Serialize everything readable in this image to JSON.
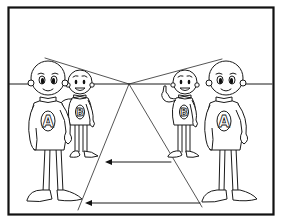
{
  "panel": {
    "description": "Perspective drawing lesson panel: two pairs of characters (A and B) placed on either side of a vanishing point, with horizon line, perspective guide lines and arrows showing depth",
    "frame_color": "#111111",
    "background_color": "#ffffff"
  },
  "horizon": {
    "y": 84,
    "label": "horizon line"
  },
  "vanishing_point": {
    "x": 129,
    "y": 84
  },
  "characters": [
    {
      "id": "left-a",
      "letter": "A",
      "side": "left",
      "size": "large",
      "expression": "smile"
    },
    {
      "id": "left-b",
      "letter": "B",
      "side": "left",
      "size": "small",
      "expression": "open-mouth smile",
      "pose": "hand on A's shoulder"
    },
    {
      "id": "right-b",
      "letter": "B",
      "side": "right",
      "size": "small",
      "expression": "open-mouth smile",
      "pose": "index finger raised"
    },
    {
      "id": "right-a",
      "letter": "A",
      "side": "right",
      "size": "large",
      "expression": "smile"
    }
  ],
  "arrows": [
    {
      "id": "arrow-upper",
      "direction": "left",
      "y": 162
    },
    {
      "id": "arrow-lower",
      "direction": "left",
      "y": 203
    }
  ]
}
